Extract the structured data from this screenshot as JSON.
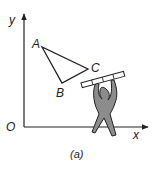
{
  "diagram": {
    "axes": {
      "x_label": "x",
      "y_label": "y",
      "origin_label": "O"
    },
    "triangle": {
      "vertices": [
        {
          "label": "A"
        },
        {
          "label": "B"
        },
        {
          "label": "C"
        }
      ]
    },
    "caption": "(a)",
    "colors": {
      "figure_fill": "#8c8c8c",
      "stroke": "#222222",
      "bar_fill": "#ffffff"
    }
  }
}
